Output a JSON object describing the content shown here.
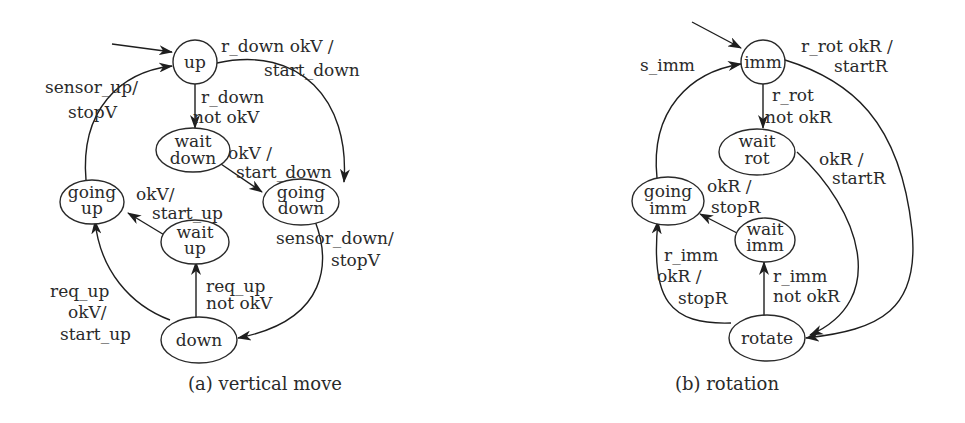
{
  "diagrams": {
    "vertical": {
      "caption": "(a) vertical move",
      "states": {
        "up": "up",
        "wait_down_1": "wait",
        "wait_down_2": "down",
        "going_down_1": "going",
        "going_down_2": "down",
        "going_up_1": "going",
        "going_up_2": "up",
        "wait_up_1": "wait",
        "wait_up_2": "up",
        "down": "down"
      },
      "transitions": {
        "up_to_going_down": [
          "r_down okV /",
          "start_down"
        ],
        "up_to_wait_down": [
          "r_down",
          "not okV"
        ],
        "wait_down_to_going_down": [
          "okV /",
          "start_down"
        ],
        "going_up_to_up": [
          "sensor_up/",
          "stopV"
        ],
        "wait_up_to_going_up": [
          "okV/",
          "start_up"
        ],
        "going_down_to_down": [
          "sensor_down/",
          "stopV"
        ],
        "down_to_wait_up": [
          "req_up",
          "not okV"
        ],
        "down_to_going_up": [
          "req_up",
          "okV/",
          "start_up"
        ]
      }
    },
    "rotation": {
      "caption": "(b) rotation",
      "states": {
        "imm": "imm",
        "wait_rot_1": "wait",
        "wait_rot_2": "rot",
        "going_imm_1": "going",
        "going_imm_2": "imm",
        "wait_imm_1": "wait",
        "wait_imm_2": "imm",
        "rotate": "rotate"
      },
      "transitions": {
        "imm_to_rotate": [
          "r_rot okR /",
          "startR"
        ],
        "going_imm_to_imm": [
          "s_imm"
        ],
        "imm_to_wait_rot": [
          "r_rot",
          "not okR"
        ],
        "wait_rot_to_rotate": [
          "okR /",
          "startR"
        ],
        "wait_imm_to_going_imm": [
          "okR /",
          "stopR"
        ],
        "rotate_to_wait_imm": [
          "r_imm",
          "not okR"
        ],
        "rotate_to_going_imm": [
          "r_imm",
          "okR /",
          "stopR"
        ]
      }
    }
  }
}
